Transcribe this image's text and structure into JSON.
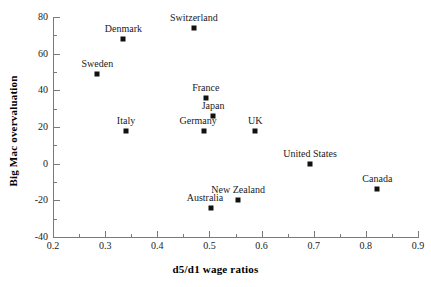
{
  "chart_data": {
    "type": "scatter",
    "title": "",
    "xlabel": "d5/d1 wage ratios",
    "ylabel": "Big Mac overvaluation",
    "xlim": [
      0.2,
      0.9
    ],
    "ylim": [
      -40,
      80
    ],
    "x_major_ticks": [
      0.2,
      0.3,
      0.4,
      0.5,
      0.6,
      0.7,
      0.8,
      0.9
    ],
    "x_minor_ticks": [
      0.25,
      0.35,
      0.45,
      0.55,
      0.65,
      0.75,
      0.85
    ],
    "y_major_ticks": [
      -40,
      -20,
      0,
      20,
      40,
      60,
      80
    ],
    "y_minor_ticks": [
      -30,
      -10,
      10,
      30,
      50,
      70
    ],
    "x_tick_labels": [
      "0.2",
      "0.3",
      "0.4",
      "0.5",
      "0.6",
      "0.7",
      "0.8",
      "0.9"
    ],
    "y_tick_labels": [
      "80",
      "60",
      "40",
      "20",
      "0",
      "-20",
      "-40"
    ],
    "grid": false,
    "legend": false,
    "marker_color": "#111111",
    "axis_color": "#7a7a7a",
    "background_color": "#ffffff",
    "points": [
      {
        "label": "Switzerland",
        "x": 0.47,
        "y": 74,
        "label_pos": "above"
      },
      {
        "label": "Denmark",
        "x": 0.335,
        "y": 68,
        "label_pos": "above"
      },
      {
        "label": "Sweden",
        "x": 0.285,
        "y": 49,
        "label_pos": "above"
      },
      {
        "label": "France",
        "x": 0.493,
        "y": 36,
        "label_pos": "above"
      },
      {
        "label": "Japan",
        "x": 0.507,
        "y": 26,
        "label_pos": "above"
      },
      {
        "label": "Italy",
        "x": 0.34,
        "y": 18,
        "label_pos": "above"
      },
      {
        "label": "Germany",
        "x": 0.49,
        "y": 18,
        "label_pos": "above-left"
      },
      {
        "label": "UK",
        "x": 0.588,
        "y": 18,
        "label_pos": "above"
      },
      {
        "label": "United States",
        "x": 0.693,
        "y": 0,
        "label_pos": "above"
      },
      {
        "label": "Canada",
        "x": 0.822,
        "y": -14,
        "label_pos": "above"
      },
      {
        "label": "New Zealand",
        "x": 0.555,
        "y": -20,
        "label_pos": "above"
      },
      {
        "label": "Australia",
        "x": 0.503,
        "y": -24,
        "label_pos": "above-left"
      }
    ]
  }
}
